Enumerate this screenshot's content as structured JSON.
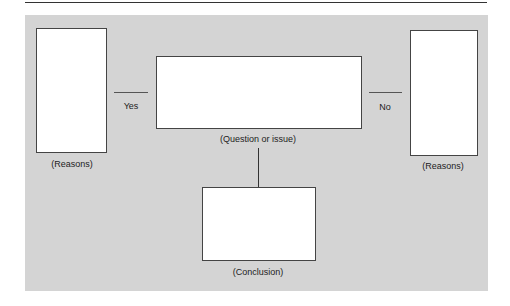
{
  "diagram": {
    "type": "argument-map",
    "colors": {
      "background": "#d4d4d4",
      "box_fill": "#ffffff",
      "stroke": "#444444"
    },
    "nodes": {
      "reasons_left": {
        "label": "(Reasons)"
      },
      "question": {
        "label": "(Question or issue)"
      },
      "reasons_right": {
        "label": "(Reasons)"
      },
      "conclusion": {
        "label": "(Conclusion)"
      }
    },
    "edges": {
      "yes": {
        "label": "Yes",
        "from": "question",
        "to": "reasons_left"
      },
      "no": {
        "label": "No",
        "from": "question",
        "to": "reasons_right"
      },
      "conclusion_link": {
        "from": "question",
        "to": "conclusion"
      }
    }
  }
}
